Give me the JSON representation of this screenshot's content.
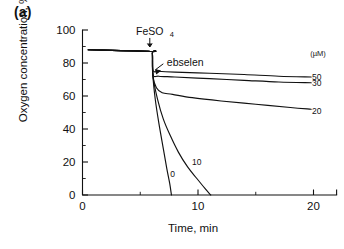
{
  "panel": {
    "label": "(a)"
  },
  "chart_data": {
    "type": "line",
    "title": "",
    "xlabel": "Time, min",
    "ylabel": "Oxygen concentration, %",
    "xlim": [
      0,
      22
    ],
    "ylim": [
      0,
      100
    ],
    "xticks": [
      0,
      10,
      20
    ],
    "xtick_labels": [
      "0",
      "10",
      "20"
    ],
    "xticks_minor": [
      5,
      15
    ],
    "yticks": [
      0,
      20,
      40,
      60,
      80,
      100
    ],
    "ytick_labels": [
      "0",
      "20",
      "40",
      "60",
      "80",
      "100"
    ],
    "yticks_minor": [
      10,
      30,
      50,
      70,
      90
    ],
    "grid": false,
    "legend_position": "right",
    "legend_title": "(µM)",
    "annotations": [
      {
        "text": "FeSO",
        "subscript": "4",
        "x": 6.0,
        "y": 97,
        "note": "arrow points down to baseline at t=6 min where FeSO4 is added"
      },
      {
        "text": "ebselen",
        "x": 7.3,
        "y": 78,
        "note": "arrow points up-left to the drop point at t=6.1 min"
      }
    ],
    "series": [
      {
        "name": "0",
        "label": "0",
        "concentration_uM": 0,
        "label_position": {
          "x": 7.8,
          "y": 11
        },
        "points": [
          [
            0.5,
            88
          ],
          [
            5.9,
            87
          ],
          [
            6.05,
            86
          ],
          [
            6.1,
            72
          ],
          [
            6.3,
            58
          ],
          [
            6.6,
            44
          ],
          [
            7.0,
            28
          ],
          [
            7.3,
            16
          ],
          [
            7.55,
            7
          ],
          [
            7.7,
            0
          ]
        ]
      },
      {
        "name": "10",
        "label": "10",
        "concentration_uM": 10,
        "label_position": {
          "x": 9.9,
          "y": 18
        },
        "points": [
          [
            0.5,
            88
          ],
          [
            5.9,
            87
          ],
          [
            6.05,
            86
          ],
          [
            6.1,
            72
          ],
          [
            6.5,
            58
          ],
          [
            7.0,
            46
          ],
          [
            7.6,
            36
          ],
          [
            8.3,
            26
          ],
          [
            9.1,
            17
          ],
          [
            9.9,
            10
          ],
          [
            10.6,
            4
          ],
          [
            11.1,
            0
          ]
        ]
      },
      {
        "name": "20",
        "label": "20",
        "concentration_uM": 20,
        "label_position": {
          "x": 20.2,
          "y": 51
        },
        "points": [
          [
            0.5,
            88
          ],
          [
            5.9,
            87
          ],
          [
            6.05,
            86
          ],
          [
            6.1,
            72
          ],
          [
            6.4,
            65
          ],
          [
            6.9,
            62
          ],
          [
            7.8,
            61
          ],
          [
            9.5,
            59
          ],
          [
            12.0,
            57
          ],
          [
            15.0,
            55
          ],
          [
            18.0,
            53
          ],
          [
            19.8,
            52
          ]
        ]
      },
      {
        "name": "30",
        "label": "30",
        "concentration_uM": 30,
        "label_position": {
          "x": 20.2,
          "y": 68
        },
        "points": [
          [
            0.5,
            88
          ],
          [
            5.9,
            87
          ],
          [
            6.05,
            86
          ],
          [
            6.1,
            73
          ],
          [
            6.6,
            72
          ],
          [
            8.0,
            71.5
          ],
          [
            11.0,
            70.5
          ],
          [
            14.0,
            69.5
          ],
          [
            17.0,
            68.5
          ],
          [
            19.8,
            68
          ]
        ]
      },
      {
        "name": "50",
        "label": "50",
        "concentration_uM": 50,
        "label_position": {
          "x": 20.2,
          "y": 71.5
        },
        "points": [
          [
            0.5,
            88
          ],
          [
            5.9,
            87
          ],
          [
            6.05,
            86
          ],
          [
            6.1,
            75.5
          ],
          [
            6.6,
            75
          ],
          [
            8.0,
            74.5
          ],
          [
            11.0,
            73.8
          ],
          [
            14.0,
            73
          ],
          [
            17.0,
            72
          ],
          [
            19.8,
            71.5
          ]
        ]
      }
    ]
  }
}
